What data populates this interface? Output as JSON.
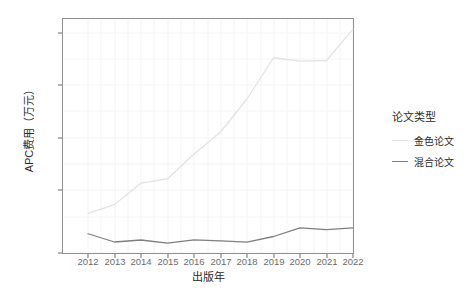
{
  "chart_data": {
    "type": "line",
    "title": "",
    "xlabel": "出版年",
    "ylabel": "APC费用（万元）",
    "x": [
      2012,
      2013,
      2014,
      2015,
      2016,
      2017,
      2018,
      2019,
      2020,
      2021,
      2022
    ],
    "xtick_labels": [
      "2012",
      "2013",
      "2014",
      "2015",
      "2016",
      "2017",
      "2018",
      "2019",
      "2020",
      "2021",
      "2022"
    ],
    "ytick_labels": [
      "0",
      "500",
      "1000",
      "1500",
      "2000"
    ],
    "yticks": [
      0,
      500,
      1000,
      1500,
      2000
    ],
    "ylim": [
      -60,
      2100
    ],
    "xlim": [
      2011.5,
      2022.5
    ],
    "grid": true,
    "legend_position": "right",
    "legend_title": "论文类型",
    "series": [
      {
        "name": "金色论文",
        "color": "#e3e3e3",
        "values": [
          360,
          440,
          635,
          675,
          900,
          1100,
          1400,
          1775,
          1745,
          1750,
          2035
        ]
      },
      {
        "name": "混合论文",
        "color": "#7f7f7f",
        "values": [
          175,
          100,
          118,
          90,
          120,
          110,
          98,
          150,
          228,
          212,
          228
        ]
      }
    ]
  },
  "legend": {
    "title": "论文类型",
    "items": [
      {
        "label": "金色论文",
        "color": "#e3e3e3"
      },
      {
        "label": "混合论文",
        "color": "#7f7f7f"
      }
    ]
  },
  "panel": {
    "background": "#ffffff",
    "border_color": "#9a9a9a",
    "grid_color": "#f2f2f2"
  }
}
